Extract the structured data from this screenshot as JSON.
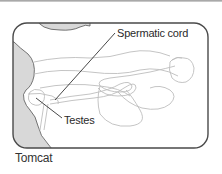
{
  "figure": {
    "labels": {
      "spermatic_cord": "Spermatic cord",
      "testes": "Testes"
    },
    "caption": "Tomcat"
  },
  "colors": {
    "frame": "#4a4a4a",
    "body_fill": "#d8d8d8",
    "outline": "#bdbdbd",
    "leader_line": "#333333",
    "background": "#ffffff"
  }
}
